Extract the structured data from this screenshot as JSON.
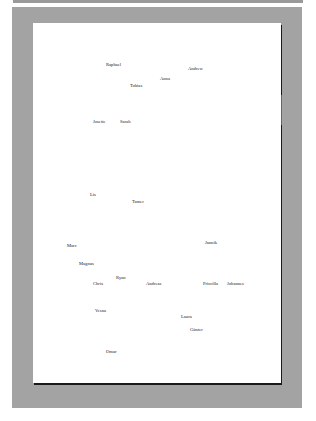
{
  "colors": {
    "background": "#ffffff",
    "frame": "#a3a3a3",
    "page": "#ffffff",
    "text": "#222222"
  },
  "names": [
    {
      "label": "Raphael",
      "x": 106,
      "y": 63
    },
    {
      "label": "Andrew",
      "x": 188,
      "y": 67
    },
    {
      "label": "Anna",
      "x": 160,
      "y": 77
    },
    {
      "label": "Tobias",
      "x": 130,
      "y": 84
    },
    {
      "label": "Josette",
      "x": 93,
      "y": 120
    },
    {
      "label": "Sarah",
      "x": 120,
      "y": 120
    },
    {
      "label": "Lis",
      "x": 90,
      "y": 193
    },
    {
      "label": "Tamer",
      "x": 132,
      "y": 200
    },
    {
      "label": "Marc",
      "x": 67,
      "y": 244
    },
    {
      "label": "Jannik",
      "x": 205,
      "y": 241
    },
    {
      "label": "Magnus",
      "x": 79,
      "y": 262
    },
    {
      "label": "Ryan",
      "x": 116,
      "y": 276
    },
    {
      "label": "Chris",
      "x": 93,
      "y": 282
    },
    {
      "label": "Andreas",
      "x": 146,
      "y": 282
    },
    {
      "label": "Priscilla",
      "x": 203,
      "y": 282
    },
    {
      "label": "Johannes",
      "x": 227,
      "y": 282
    },
    {
      "label": "Vesna",
      "x": 95,
      "y": 309
    },
    {
      "label": "Laura",
      "x": 181,
      "y": 315
    },
    {
      "label": "Günter",
      "x": 190,
      "y": 328
    },
    {
      "label": "Omar",
      "x": 106,
      "y": 350
    }
  ]
}
